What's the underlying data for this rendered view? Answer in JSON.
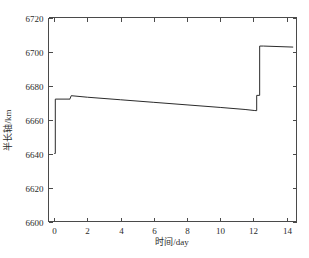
{
  "chart_data": {
    "type": "line",
    "title": "",
    "xlabel": "时间/day",
    "ylabel": "半长轴/km",
    "xlim": [
      -0.35,
      14.6
    ],
    "ylim": [
      6600,
      6720
    ],
    "xticks": [
      0,
      2,
      4,
      6,
      8,
      10,
      12,
      14
    ],
    "xticklabels": [
      "0",
      "2",
      "4",
      "6",
      "8",
      "10",
      "12",
      "14"
    ],
    "yticks": [
      6600,
      6620,
      6640,
      6660,
      6680,
      6700,
      6720
    ],
    "yticklabels": [
      "6600",
      "6620",
      "6640",
      "6660",
      "6680",
      "6700",
      "6720"
    ],
    "grid": false,
    "legend": null,
    "series": [
      {
        "name": "半长轴",
        "color": "#2b2b2b",
        "x": [
          0.0,
          0.06,
          0.06,
          0.95,
          0.95,
          1.02,
          1.02,
          2.0,
          4.0,
          6.0,
          8.0,
          10.0,
          11.5,
          12.05,
          12.05,
          12.2,
          12.2,
          12.38,
          12.38,
          12.6,
          14.4
        ],
        "y": [
          6640.0,
          6640.0,
          6672.0,
          6672.0,
          6672.2,
          6674.0,
          6674.0,
          6673.1,
          6671.6,
          6670.1,
          6668.6,
          6667.1,
          6665.9,
          6665.3,
          6665.3,
          6665.2,
          6674.2,
          6674.2,
          6703.2,
          6703.2,
          6702.6
        ]
      }
    ]
  }
}
